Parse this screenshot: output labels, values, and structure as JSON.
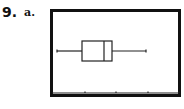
{
  "problem": {
    "number": "9.",
    "part": "a."
  },
  "chart_data": {
    "type": "boxplot",
    "title": "",
    "xlabel": "",
    "ylabel": "",
    "orientation": "horizontal",
    "axis_ticks_px": [
      85,
      116,
      148,
      179
    ],
    "tick_labels": [],
    "grid": false,
    "series": [
      {
        "name": "data",
        "min": 0.0,
        "q1": 0.8,
        "median": 1.5,
        "q3": 1.76,
        "max": 2.9
      }
    ],
    "note": "Graphing-calculator style box plot with no numeric tick labels; values in units of tick spacing from left whisker (approx.)"
  },
  "plot_px": {
    "whisker_y": 51,
    "box_top": 41,
    "box_bottom": 61,
    "min_x": 57,
    "q1_x": 82,
    "median_x": 104,
    "q3_x": 112,
    "max_x": 146,
    "axis_y": 93,
    "axis_x0": 52,
    "axis_x1": 179
  }
}
